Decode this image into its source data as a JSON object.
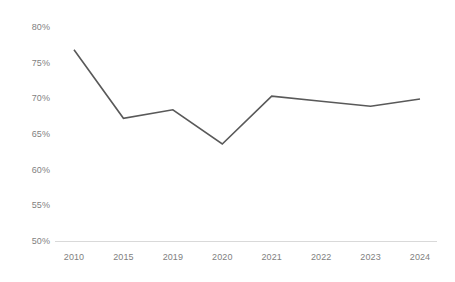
{
  "chart_data": {
    "type": "line",
    "title": "",
    "subtitle": "",
    "xlabel": "",
    "ylabel": "",
    "categories": [
      "2010",
      "2015",
      "2019",
      "2020",
      "2021",
      "2022",
      "2023",
      "2024"
    ],
    "series": [
      {
        "name": "",
        "values": [
          76.8,
          67.2,
          68.4,
          63.6,
          70.3,
          69.6,
          68.9,
          69.9
        ]
      }
    ],
    "ylim": [
      50,
      80
    ],
    "ytick_values": [
      80,
      75,
      70,
      65,
      60,
      55,
      50
    ],
    "ytick_labels": [
      "80%",
      "75%",
      "70%",
      "65%",
      "60%",
      "55%",
      "50%"
    ],
    "xtick_labels": [
      "2010",
      "2015",
      "2019",
      "2020",
      "2021",
      "2022",
      "2023",
      "2024"
    ],
    "grid": false,
    "legend": "none",
    "annotations": [],
    "colors": {
      "line": "#595959",
      "axis": "#d9d9d9",
      "tick_label": "#7f7f7f",
      "background": "#ffffff"
    }
  }
}
